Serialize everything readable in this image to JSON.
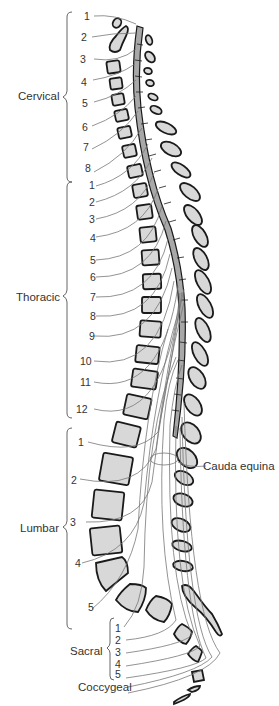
{
  "figure": {
    "type": "anatomical-diagram"
  },
  "groups": {
    "cervical": {
      "label": "Cervical",
      "numbers": [
        "1",
        "2",
        "3",
        "4",
        "5",
        "6",
        "7",
        "8"
      ]
    },
    "thoracic": {
      "label": "Thoracic",
      "numbers": [
        "1",
        "2",
        "3",
        "4",
        "5",
        "6",
        "7",
        "8",
        "9",
        "10",
        "11",
        "12"
      ]
    },
    "lumbar": {
      "label": "Lumbar",
      "numbers": [
        "1",
        "2",
        "3",
        "4",
        "5"
      ]
    },
    "sacral": {
      "label": "Sacral",
      "numbers": [
        "1",
        "2",
        "3",
        "4",
        "5"
      ]
    },
    "coccygeal": {
      "label": "Coccygeal"
    }
  },
  "annotations": {
    "cauda_equina": "Cauda equina"
  },
  "colors": {
    "bone_fill": "#d8d8d8",
    "cord_fill": "#a8a8a8",
    "outline": "#1a1a1a",
    "nerve": "#777777",
    "text": "#333333"
  }
}
